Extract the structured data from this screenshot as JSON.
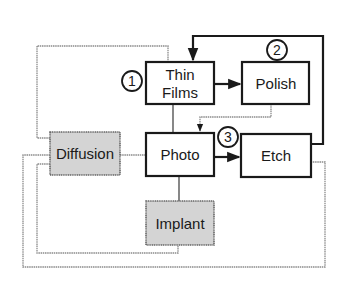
{
  "diagram": {
    "type": "process-flow",
    "boxes": {
      "thin_films": {
        "label_line1": "Thin",
        "label_line2": "Films",
        "style": "outlined"
      },
      "polish": {
        "label": "Polish",
        "style": "outlined"
      },
      "photo": {
        "label": "Photo",
        "style": "outlined"
      },
      "etch": {
        "label": "Etch",
        "style": "outlined"
      },
      "diffusion": {
        "label": "Diffusion",
        "style": "shaded"
      },
      "implant": {
        "label": "Implant",
        "style": "shaded"
      }
    },
    "markers": [
      {
        "label": "1",
        "near": "Thin Films"
      },
      {
        "label": "2",
        "near": "Polish"
      },
      {
        "label": "3",
        "near": "Photo → Etch"
      }
    ],
    "edges": [
      {
        "from": "Thin Films",
        "to": "Polish",
        "style": "bold-arrow"
      },
      {
        "from": "Photo",
        "to": "Etch",
        "style": "bold-arrow"
      },
      {
        "from": "Etch",
        "to": "Thin Films",
        "style": "bold-arrow",
        "route": "top loop"
      },
      {
        "from": "Polish",
        "to": "Photo",
        "style": "grey-arrow"
      },
      {
        "from": "Thin Films",
        "to": "Photo",
        "style": "line"
      },
      {
        "from": "Photo",
        "to": "Implant",
        "style": "line"
      },
      {
        "from": "Diffusion",
        "to": "Photo",
        "style": "grey-line"
      },
      {
        "from": "Diffusion",
        "to": "Thin Films",
        "style": "grey-line"
      },
      {
        "from": "Diffusion",
        "to": "Implant",
        "style": "grey-line"
      },
      {
        "from": "Diffusion",
        "to": "Etch",
        "style": "grey-line"
      }
    ],
    "colors": {
      "bold_line": "#1a1a1a",
      "grey_line": "#8a8a8a",
      "shaded_fill": "#d4d4d4"
    }
  }
}
